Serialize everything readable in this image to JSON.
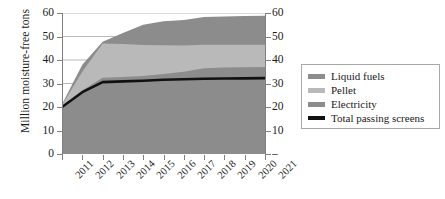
{
  "chart_data": {
    "type": "area",
    "title": "",
    "xlabel": "",
    "ylabel": "Million moisture-free tons",
    "categories": [
      "2011",
      "2012",
      "2013",
      "2014",
      "2015",
      "2016",
      "2017",
      "2018",
      "2019",
      "2020",
      "2021"
    ],
    "ylim": [
      0,
      60
    ],
    "yticks": [
      0,
      10,
      20,
      30,
      40,
      50,
      60
    ],
    "ytick_labels_left": [
      "0",
      "10",
      "20",
      "30",
      "40",
      "50",
      "60"
    ],
    "ytick_labels_right": [
      "–",
      "10",
      "20",
      "30",
      "40",
      "50",
      "60"
    ],
    "grid": true,
    "stacked": true,
    "legend_position": "right",
    "series": [
      {
        "name": "Electricity",
        "type": "area",
        "color": "#8c8c8c",
        "values": [
          20.0,
          27.0,
          32.5,
          32.8,
          33.2,
          34.0,
          35.0,
          36.5,
          36.8,
          36.9,
          37.0
        ]
      },
      {
        "name": "Pellet",
        "type": "area",
        "color": "#b9b9b9",
        "values": [
          0.8,
          8.0,
          14.5,
          14.0,
          13.2,
          12.3,
          11.2,
          10.0,
          9.7,
          9.6,
          9.5
        ]
      },
      {
        "name": "Liquid fuels",
        "type": "area",
        "color": "#8c8c8c",
        "values": [
          0.4,
          3.0,
          0.8,
          4.7,
          8.6,
          10.2,
          10.8,
          11.8,
          12.0,
          12.2,
          12.3
        ]
      },
      {
        "name": "Total passing screens",
        "type": "line",
        "color": "#111111",
        "values": [
          20.0,
          26.3,
          30.6,
          30.9,
          31.2,
          31.6,
          31.8,
          32.0,
          32.1,
          32.2,
          32.3
        ]
      }
    ],
    "stack_tops": {
      "electricity": [
        20.0,
        27.0,
        32.5,
        32.8,
        33.2,
        34.0,
        35.0,
        36.5,
        36.8,
        36.9,
        37.0
      ],
      "pellet": [
        20.8,
        35.0,
        47.0,
        46.8,
        46.4,
        46.3,
        46.2,
        46.5,
        46.5,
        46.5,
        46.5
      ],
      "liquid_fuels": [
        21.2,
        38.0,
        47.8,
        51.5,
        55.0,
        56.5,
        57.0,
        58.3,
        58.5,
        58.7,
        58.8
      ]
    }
  },
  "legend": {
    "items": [
      {
        "label": "Liquid fuels",
        "color": "#8c8c8c",
        "kind": "area"
      },
      {
        "label": "Pellet",
        "color": "#b9b9b9",
        "kind": "area"
      },
      {
        "label": "Electricity",
        "color": "#8c8c8c",
        "kind": "area"
      },
      {
        "label": "Total passing screens",
        "color": "#111111",
        "kind": "line"
      }
    ]
  }
}
